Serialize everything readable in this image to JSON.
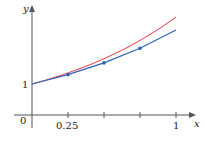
{
  "chart_data": {
    "type": "line",
    "title": "",
    "xlabel": "x",
    "ylabel": "y",
    "x_ticks": [
      0,
      0.25,
      0.5,
      0.75,
      1
    ],
    "x_tick_labels": [
      "0",
      "0.25",
      "",
      "",
      "1"
    ],
    "y_tick_labels": [
      "1"
    ],
    "xlim": [
      0,
      1
    ],
    "grid": false,
    "legend": null,
    "series": [
      {
        "name": "exact solution y = e^x",
        "color": "#e8303c",
        "style": "curve",
        "x": [
          0,
          0.1,
          0.2,
          0.3,
          0.4,
          0.5,
          0.6,
          0.7,
          0.8,
          0.9,
          1.0
        ],
        "values": [
          1,
          1.105,
          1.221,
          1.35,
          1.492,
          1.649,
          1.822,
          2.014,
          2.226,
          2.46,
          2.718
        ]
      },
      {
        "name": "Euler approximation (h = 0.25)",
        "color": "#2f63b8",
        "style": "polyline-with-markers",
        "x": [
          0,
          0.25,
          0.5,
          0.75,
          1.0
        ],
        "values": [
          1,
          1.25,
          1.5625,
          1.9531,
          2.4414
        ]
      }
    ]
  },
  "labels": {
    "x_axis": "x",
    "y_axis": "y",
    "origin": "0",
    "tick_025": "0.25",
    "tick_1": "1",
    "y_one": "1"
  }
}
